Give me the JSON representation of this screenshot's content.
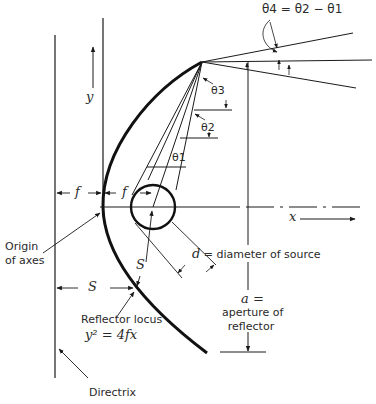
{
  "diagram": {
    "labels": {
      "theta4_eq": "θ4 = θ2 − θ1",
      "theta3": "θ3",
      "theta2": "θ2",
      "theta1": "θ1",
      "y_axis": "y",
      "x_axis": "x",
      "f_left": "f",
      "f_right": "f",
      "origin_line1": "Origin",
      "origin_line2": "of axes",
      "s_diag": "S",
      "s_horiz": "S",
      "d_symbol": "d",
      "d_text": "= diameter of source",
      "a_symbol": "a =",
      "aperture_line1": "aperture of",
      "aperture_line2": "reflector",
      "reflector_locus": "Reflector locus",
      "equation": "y² = 4fx",
      "directrix": "Directrix"
    },
    "stroke_color": "#1a1a1a",
    "text_color": "#2a2a2a"
  }
}
